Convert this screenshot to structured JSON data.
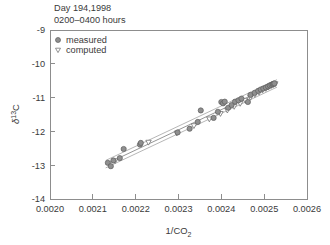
{
  "chart_data": {
    "type": "scatter",
    "title": "",
    "annotations": [
      "Day 194,1998",
      "0200–0400 hours"
    ],
    "xlabel": "1/CO2",
    "xlabel_rich": "1/CO₂",
    "ylabel": "δ13C",
    "ylabel_rich": "δ¹³C",
    "xlim": [
      0.002,
      0.0026
    ],
    "ylim": [
      -14,
      -9
    ],
    "grid": false,
    "legend_position": "top-left-inside",
    "xticks": [
      "0.0020",
      "0.0021",
      "0.0022",
      "0.0023",
      "0.0024",
      "0.0025",
      "0.0026"
    ],
    "xtick_values": [
      0.002,
      0.0021,
      0.0022,
      0.0023,
      0.0024,
      0.0025,
      0.0026
    ],
    "yticks": [
      "-9",
      "-10",
      "-11",
      "-12",
      "-13",
      "-14"
    ],
    "ytick_values": [
      -9,
      -10,
      -11,
      -12,
      -13,
      -14
    ],
    "legend": [
      {
        "label": "measured",
        "marker": "filled-circle",
        "color": "#8f8f8f"
      },
      {
        "label": "computed",
        "marker": "open-triangle-down",
        "color": "#6e6e6e"
      }
    ],
    "series": [
      {
        "name": "measured",
        "marker": "filled-circle",
        "points": [
          [
            0.002135,
            -12.93
          ],
          [
            0.002142,
            -13.03
          ],
          [
            0.002148,
            -12.86
          ],
          [
            0.002163,
            -12.79
          ],
          [
            0.002172,
            -12.52
          ],
          [
            0.00221,
            -12.39
          ],
          [
            0.002212,
            -12.34
          ],
          [
            0.002298,
            -12.03
          ],
          [
            0.002326,
            -11.92
          ],
          [
            0.002345,
            -11.72
          ],
          [
            0.002352,
            -11.38
          ],
          [
            0.002382,
            -11.6
          ],
          [
            0.002392,
            -11.42
          ],
          [
            0.0024,
            -11.13
          ],
          [
            0.002404,
            -11.17
          ],
          [
            0.002408,
            -11.12
          ],
          [
            0.002416,
            -11.3
          ],
          [
            0.002424,
            -11.22
          ],
          [
            0.002432,
            -11.12
          ],
          [
            0.00244,
            -11.08
          ],
          [
            0.002447,
            -11.03
          ],
          [
            0.002462,
            -11.13
          ],
          [
            0.002468,
            -10.92
          ],
          [
            0.002478,
            -10.86
          ],
          [
            0.002486,
            -10.8
          ],
          [
            0.002492,
            -10.76
          ],
          [
            0.002498,
            -10.73
          ],
          [
            0.002504,
            -10.7
          ],
          [
            0.002509,
            -10.67
          ],
          [
            0.002513,
            -10.64
          ],
          [
            0.002517,
            -10.62
          ],
          [
            0.00252,
            -10.6
          ],
          [
            0.002522,
            -10.59
          ],
          [
            0.002524,
            -10.58
          ]
        ]
      },
      {
        "name": "computed",
        "marker": "open-triangle-down",
        "points": [
          [
            0.002152,
            -12.88
          ],
          [
            0.00223,
            -12.33
          ],
          [
            0.002296,
            -12.06
          ],
          [
            0.002336,
            -11.84
          ],
          [
            0.002372,
            -11.64
          ],
          [
            0.002398,
            -11.48
          ],
          [
            0.002414,
            -11.38
          ],
          [
            0.00243,
            -11.27
          ],
          [
            0.002444,
            -11.18
          ],
          [
            0.002456,
            -11.09
          ],
          [
            0.002468,
            -11.0
          ],
          [
            0.002478,
            -10.92
          ],
          [
            0.002488,
            -10.85
          ],
          [
            0.002496,
            -10.79
          ],
          [
            0.002504,
            -10.74
          ],
          [
            0.00251,
            -10.7
          ],
          [
            0.002516,
            -10.66
          ],
          [
            0.002521,
            -10.63
          ],
          [
            0.002526,
            -10.6
          ]
        ]
      }
    ],
    "fit_line": {
      "name": "keeling-regression",
      "x": [
        0.00213,
        0.00253
      ],
      "y": [
        -12.97,
        -10.58
      ]
    },
    "confidence_band": {
      "name": "confidence-interval",
      "offset": 0.11
    }
  }
}
